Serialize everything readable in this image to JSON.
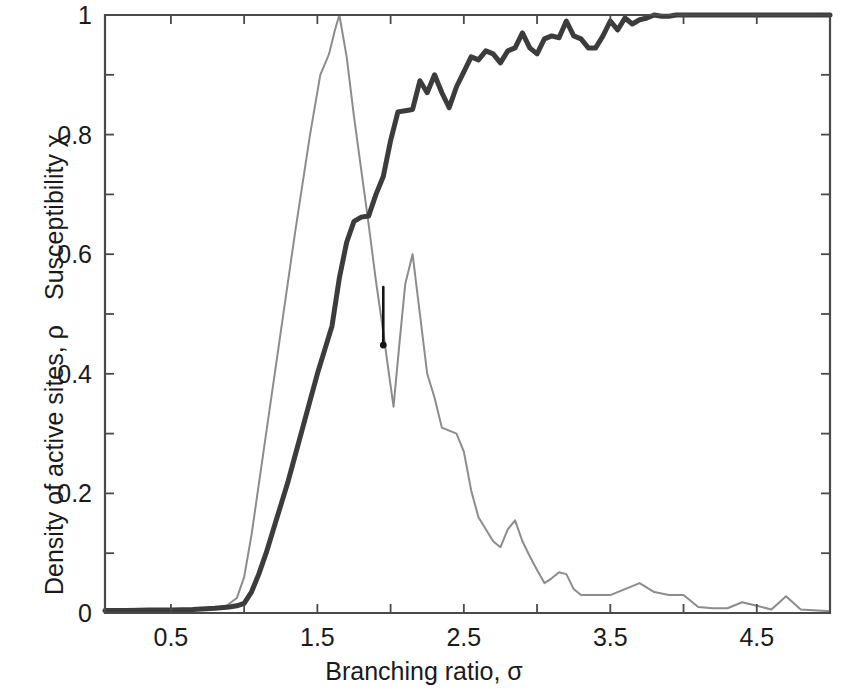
{
  "chart_data": {
    "type": "line",
    "title": "",
    "xlabel": "Branching ratio, σ",
    "ylabel_upper": "Susceptibility χ",
    "ylabel_lower": "Density of active sites, ρ",
    "xlim": [
      0.05,
      5.0
    ],
    "ylim": [
      0,
      1
    ],
    "xticks": [
      0.5,
      1.5,
      2.5,
      3.5,
      4.5
    ],
    "xtick_labels": [
      "0.5",
      "1.5",
      "2.5",
      "3.5",
      "4.5"
    ],
    "xminor_ticks": [
      1.0,
      2.0,
      3.0,
      4.0,
      5.0
    ],
    "yticks": [
      0,
      0.2,
      0.4,
      0.6,
      0.8,
      1
    ],
    "ytick_labels": [
      "0",
      "0.2",
      "0.4",
      "0.6",
      "0.8",
      "1"
    ],
    "yminor_ticks": [
      0.1,
      0.3,
      0.5,
      0.7,
      0.9
    ],
    "grid": false,
    "legend": "none",
    "colors": {
      "density_curve": "#3c3c3c",
      "susceptibility_curve": "#8c8c8c",
      "axis": "#4a4a4a",
      "marker": "#151515",
      "background": "#ffffff"
    },
    "series": [
      {
        "name": "Density of active sites, ρ",
        "style": "thick-dark-line",
        "color": "#3c3c3c",
        "x": [
          0.05,
          0.2,
          0.35,
          0.5,
          0.65,
          0.8,
          0.9,
          0.95,
          1.0,
          1.05,
          1.1,
          1.15,
          1.2,
          1.25,
          1.3,
          1.35,
          1.4,
          1.45,
          1.5,
          1.55,
          1.6,
          1.65,
          1.7,
          1.75,
          1.8,
          1.85,
          1.9,
          1.95,
          2.0,
          2.05,
          2.1,
          2.15,
          2.2,
          2.25,
          2.3,
          2.35,
          2.4,
          2.45,
          2.5,
          2.55,
          2.6,
          2.65,
          2.7,
          2.75,
          2.8,
          2.85,
          2.9,
          2.95,
          3.0,
          3.05,
          3.1,
          3.15,
          3.2,
          3.25,
          3.3,
          3.35,
          3.4,
          3.45,
          3.5,
          3.55,
          3.6,
          3.65,
          3.7,
          3.75,
          3.8,
          3.85,
          3.9,
          3.95,
          4.0,
          4.05,
          4.1,
          4.2,
          4.3,
          4.4,
          4.5,
          4.6,
          4.7,
          4.8,
          5.0
        ],
        "y": [
          0.004,
          0.004,
          0.005,
          0.005,
          0.006,
          0.008,
          0.01,
          0.012,
          0.016,
          0.035,
          0.065,
          0.1,
          0.14,
          0.18,
          0.22,
          0.265,
          0.31,
          0.355,
          0.4,
          0.44,
          0.48,
          0.56,
          0.62,
          0.655,
          0.662,
          0.664,
          0.7,
          0.73,
          0.79,
          0.838,
          0.84,
          0.842,
          0.89,
          0.87,
          0.9,
          0.87,
          0.845,
          0.88,
          0.905,
          0.93,
          0.925,
          0.94,
          0.935,
          0.92,
          0.94,
          0.945,
          0.97,
          0.945,
          0.935,
          0.96,
          0.965,
          0.962,
          0.99,
          0.965,
          0.96,
          0.945,
          0.945,
          0.965,
          0.99,
          0.975,
          0.995,
          0.985,
          0.992,
          0.995,
          1.0,
          0.998,
          0.998,
          1.0,
          1.0,
          1.0,
          1.0,
          1.0,
          1.0,
          1.0,
          1.0,
          1.0,
          1.0,
          1.0,
          1.0
        ]
      },
      {
        "name": "Susceptibility χ",
        "style": "thin-gray-line",
        "color": "#8c8c8c",
        "x": [
          0.05,
          0.3,
          0.55,
          0.7,
          0.8,
          0.88,
          0.95,
          1.0,
          1.05,
          1.15,
          1.25,
          1.35,
          1.45,
          1.52,
          1.58,
          1.62,
          1.65,
          1.7,
          1.75,
          1.8,
          1.85,
          1.9,
          1.95,
          1.98,
          2.02,
          2.06,
          2.1,
          2.15,
          2.2,
          2.25,
          2.3,
          2.35,
          2.4,
          2.45,
          2.5,
          2.55,
          2.6,
          2.65,
          2.7,
          2.75,
          2.8,
          2.85,
          2.9,
          2.95,
          3.0,
          3.05,
          3.1,
          3.15,
          3.2,
          3.25,
          3.3,
          3.35,
          3.4,
          3.45,
          3.5,
          3.6,
          3.7,
          3.8,
          3.9,
          4.0,
          4.1,
          4.2,
          4.3,
          4.4,
          4.5,
          4.6,
          4.7,
          4.8,
          5.0
        ],
        "y": [
          0.004,
          0.004,
          0.005,
          0.006,
          0.008,
          0.012,
          0.025,
          0.06,
          0.13,
          0.3,
          0.47,
          0.64,
          0.8,
          0.9,
          0.935,
          0.975,
          1.0,
          0.93,
          0.83,
          0.74,
          0.65,
          0.555,
          0.47,
          0.415,
          0.345,
          0.45,
          0.55,
          0.6,
          0.5,
          0.4,
          0.36,
          0.31,
          0.305,
          0.3,
          0.27,
          0.205,
          0.16,
          0.14,
          0.12,
          0.11,
          0.14,
          0.155,
          0.12,
          0.095,
          0.072,
          0.05,
          0.058,
          0.068,
          0.065,
          0.04,
          0.03,
          0.03,
          0.03,
          0.03,
          0.03,
          0.04,
          0.05,
          0.035,
          0.03,
          0.03,
          0.01,
          0.008,
          0.008,
          0.018,
          0.012,
          0.006,
          0.028,
          0.006,
          0.003
        ]
      }
    ],
    "annotation": {
      "name": "vertical-marker",
      "x": 1.95,
      "y_top": 0.545,
      "y_bottom": 0.448,
      "description": "short vertical line with a filled dot at its lower end"
    }
  }
}
